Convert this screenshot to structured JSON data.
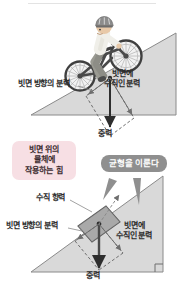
{
  "figure": {
    "title_sr": "빗면 위의 물체에 작용하는 힘",
    "top_panel": {
      "name": "cyclist-on-incline",
      "labels": {
        "parallel_component": "빗면 방향의 분력",
        "perpendicular_component_line1": "빗면에",
        "perpendicular_component_line2": "수직인 분력",
        "gravity": "중력"
      }
    },
    "callouts": {
      "pink_box_line1": "빗면 위의",
      "pink_box_line2": "물체에",
      "pink_box_line3": "작용하는 힘",
      "gray_bubble": "균형을 이룬다"
    },
    "bottom_panel": {
      "name": "block-on-incline",
      "labels": {
        "normal_force": "수직 항력",
        "parallel_component": "빗면 방향의 분력",
        "perpendicular_component_line1": "빗면에",
        "perpendicular_component_line2": "수직인 분력",
        "gravity": "중력"
      }
    }
  },
  "colors": {
    "incline_fill": "#d9d9d9",
    "incline_stroke": "#8a8a8a",
    "block_fill": "#9e9e9e",
    "block_stroke": "#5c5c5c",
    "vector_stroke": "#2e2e2e",
    "dashed_stroke": "#6e6e6e",
    "pink_box_bg": "#f7dfe4",
    "gray_bubble_bg": "#8f8f8f",
    "text": "#2b2b2b",
    "bike_frame": "#4a4a4a",
    "shirt": "#f0efe9",
    "pants": "#9a9a92",
    "skin": "#e8c9a8",
    "helmet": "#8c8c8c"
  }
}
